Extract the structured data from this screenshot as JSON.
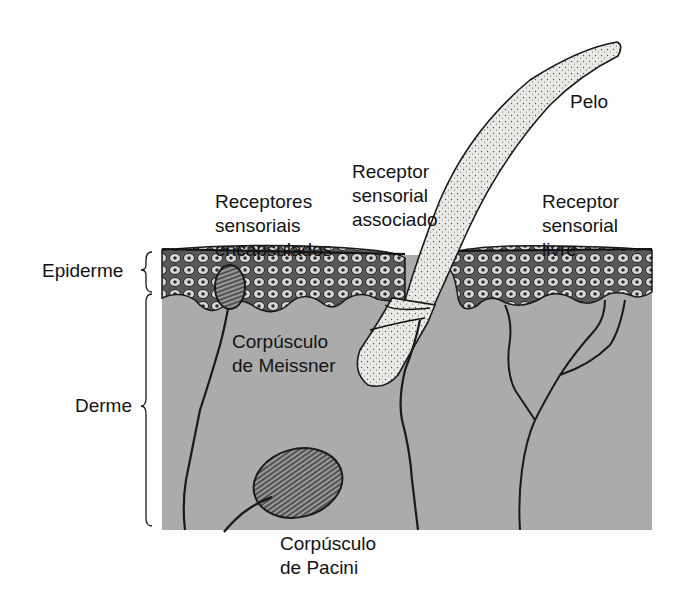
{
  "diagram": {
    "type": "anatomical-cross-section",
    "colors": {
      "background": "#fdfdfd",
      "dermis": "#ababab",
      "epidermis_fill": "#6a6a6a",
      "ink": "#1a1a1a",
      "hair_fill": "#e8e6e2"
    },
    "labels": {
      "pelo": "Pelo",
      "receptor_associado": "Receptor\nsensorial\nassociado",
      "receptores_encapsulados": "Receptores\nsensoriais\nencapsulados",
      "receptor_livre": "Receptor\nsensorial\nlivre",
      "epiderme": "Epiderme",
      "derme": "Derme",
      "meissner": "Corpúsculo\nde Meissner",
      "pacini": "Corpúsculo\nde Pacini"
    },
    "layers": [
      "Epiderme",
      "Derme"
    ],
    "structures": [
      "Pelo",
      "Receptor sensorial associado",
      "Receptores sensoriais encapsulados",
      "Receptor sensorial livre",
      "Corpúsculo de Meissner",
      "Corpúsculo de Pacini"
    ]
  }
}
